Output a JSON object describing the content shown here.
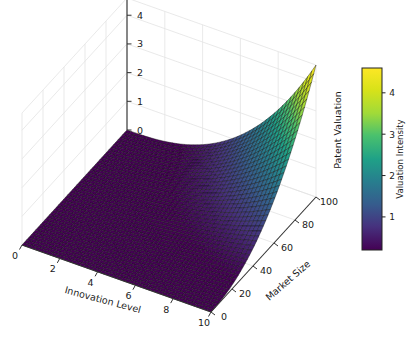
{
  "figure": {
    "background_color": "#ffffff",
    "width": 411,
    "height": 344
  },
  "chart_data": {
    "type": "surface",
    "title": "",
    "xlabel": "Innovation Level",
    "ylabel": "Market Size",
    "zlabel": "Patent Valuation",
    "colorbar_label": "Valuation Intensity",
    "colormap": "viridis",
    "grid": true,
    "legend": "none",
    "projection": "3d",
    "xlim": [
      0,
      10
    ],
    "ylim": [
      0,
      100
    ],
    "zlim": [
      0,
      4.6
    ],
    "clim": [
      0.2,
      4.6
    ],
    "xticks": [
      0,
      2,
      4,
      6,
      8,
      10
    ],
    "yticks": [
      0,
      20,
      40,
      60,
      80,
      100
    ],
    "zticks": [
      0,
      1,
      2,
      3,
      4
    ],
    "colorbar_ticks": [
      1,
      2,
      3,
      4
    ],
    "xtick_labels": [
      "0",
      "2",
      "4",
      "6",
      "8",
      "10"
    ],
    "ytick_labels": [
      "0",
      "20",
      "40",
      "60",
      "80",
      "100"
    ],
    "ztick_labels": [
      "0",
      "1",
      "2",
      "3",
      "4"
    ],
    "colorbar_tick_labels": [
      "1",
      "2",
      "3",
      "4"
    ],
    "surface_description": "Patent valuation rises sharply with both innovation level and market size, forming a steep exponential-like peak at the far corner (innovation=10, market size=100) reaching about 4.6.",
    "x_samples": [
      0,
      0.5,
      1,
      1.5,
      2,
      2.5,
      3,
      3.5,
      4,
      4.5,
      5,
      5.5,
      6,
      6.5,
      7,
      7.5,
      8,
      8.5,
      9,
      9.5,
      10
    ],
    "y_samples": [
      0,
      5,
      10,
      15,
      20,
      25,
      30,
      35,
      40,
      45,
      50,
      55,
      60,
      65,
      70,
      75,
      80,
      85,
      90,
      95,
      100
    ],
    "z_corner_values": {
      "x0_y0": 0.0,
      "x10_y0": 0.0,
      "x0_y100": 0.0,
      "x10_y100": 4.6
    },
    "colormap_stops": [
      {
        "pos": 0.0,
        "color": "#440154"
      },
      {
        "pos": 0.13,
        "color": "#46327e"
      },
      {
        "pos": 0.25,
        "color": "#365c8d"
      },
      {
        "pos": 0.38,
        "color": "#277f8e"
      },
      {
        "pos": 0.5,
        "color": "#1fa187"
      },
      {
        "pos": 0.63,
        "color": "#4ac16d"
      },
      {
        "pos": 0.75,
        "color": "#a0da39"
      },
      {
        "pos": 0.88,
        "color": "#d8e219"
      },
      {
        "pos": 1.0,
        "color": "#fde725"
      }
    ],
    "style": {
      "grid_color": "#e3e3e3",
      "axis_line_color": "#333333",
      "tick_label_color": "#1a1a1a",
      "pane_color": "#ffffff",
      "mesh_line_color": "#111111"
    }
  },
  "colorbar": {
    "label": "Valuation Intensity",
    "ticks": [
      "1",
      "2",
      "3",
      "4"
    ],
    "outline_color": "#222222"
  },
  "axes": {
    "x": {
      "title": "Innovation Level",
      "ticks": [
        "0",
        "2",
        "4",
        "6",
        "8",
        "10"
      ]
    },
    "y": {
      "title": "Market Size",
      "ticks": [
        "0",
        "20",
        "40",
        "60",
        "80",
        "100"
      ]
    },
    "z": {
      "title": "Patent Valuation",
      "ticks": [
        "0",
        "1",
        "2",
        "3",
        "4"
      ]
    }
  }
}
